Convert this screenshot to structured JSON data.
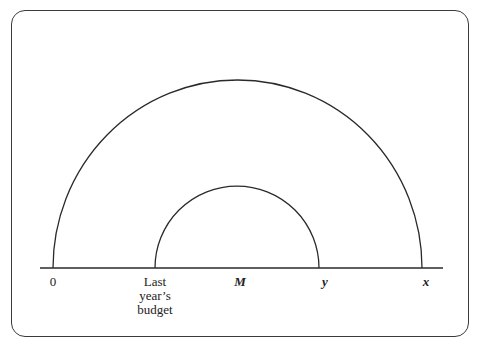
{
  "diagram": {
    "type": "nested semicircles on a number line",
    "axis": {
      "y": 268,
      "x_start": 40,
      "x_end": 443
    },
    "arcs": [
      {
        "name": "outer",
        "left_x": 53,
        "right_x": 422,
        "top_y": 80
      },
      {
        "name": "inner",
        "left_x": 155,
        "right_x": 319,
        "top_y": 186
      }
    ],
    "labels": {
      "zero": "0",
      "last_year_line1": "Last",
      "last_year_line2": "year’s",
      "last_year_line3": "budget",
      "m": "M",
      "y": "y",
      "x": "x"
    },
    "stroke_color": "#2a2a2a",
    "frame_color": "#3a3a3a"
  }
}
